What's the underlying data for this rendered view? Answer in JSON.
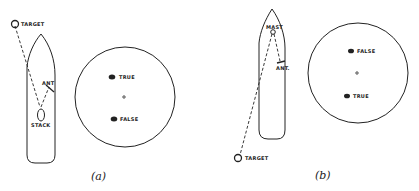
{
  "panels": [
    {
      "id": "a",
      "caption": "(a)",
      "labels": {
        "target": "TARGET",
        "ant": "ANT",
        "obstruction": "STACK"
      },
      "scope": {
        "upper_blip": "TRUE",
        "lower_blip": "FALSE"
      }
    },
    {
      "id": "b",
      "caption": "(b)",
      "labels": {
        "target": "TARGET",
        "ant": "ANT.",
        "obstruction": "MAST"
      },
      "scope": {
        "upper_blip": "FALSE",
        "lower_blip": "TRUE"
      }
    }
  ],
  "colors": {
    "ink": "#222222",
    "background": "#ffffff"
  }
}
